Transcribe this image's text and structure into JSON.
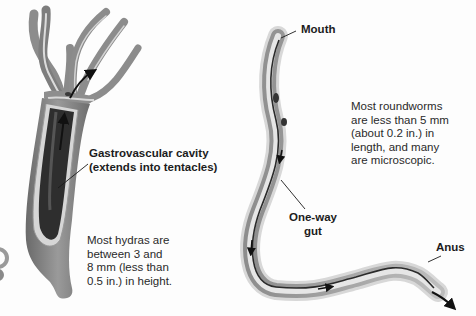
{
  "hydra": {
    "label_line1": "Gastrovascular cavity",
    "label_line2": "(extends into tentacles)",
    "note": [
      "Most hydras are",
      "between 3 and",
      "8 mm (less than",
      "0.5 in.) in height."
    ]
  },
  "roundworm": {
    "mouth_label": "Mouth",
    "gut_label_line1": "One-way",
    "gut_label_line2": "gut",
    "anus_label": "Anus",
    "note": [
      "Most roundworms",
      "are less than 5 mm",
      "(about 0.2 in.) in",
      "length, and many",
      "are microscopic."
    ]
  },
  "colors": {
    "body_dark": "#4a4a4a",
    "body_mid": "#8a8a8a",
    "body_light": "#c8c8c8",
    "cavity": "#2e2e2e",
    "text": "#1c1c1c"
  }
}
